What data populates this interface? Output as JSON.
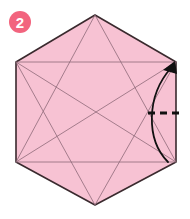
{
  "figure": {
    "title": "Origami hexagon crease pattern diagram",
    "step_label": "2",
    "background_color": "#ffffff"
  },
  "step_badge": {
    "label": "2",
    "fill_color": "#F2647E",
    "text_color": "#FFFFFF",
    "center": {
      "x": 20,
      "y": 22
    },
    "radius": 11
  },
  "shape": {
    "name": "hexagon",
    "fill_color": "#F7C2D3",
    "stroke_color": "#3A2A2E",
    "stroke_width": 1.6,
    "vertices": [
      {
        "x": 95,
        "y": 15
      },
      {
        "x": 176,
        "y": 62
      },
      {
        "x": 176,
        "y": 162
      },
      {
        "x": 95,
        "y": 205
      },
      {
        "x": 16,
        "y": 162
      },
      {
        "x": 16,
        "y": 62
      }
    ]
  },
  "crease_lines": {
    "stroke_color": "#8E6A78",
    "stroke_width": 0.8,
    "segments": [
      {
        "name": "top-horizontal-crease",
        "x1": 16,
        "y1": 62,
        "x2": 176,
        "y2": 62
      },
      {
        "name": "bottom-horizontal-crease",
        "x1": 16,
        "y1": 162,
        "x2": 176,
        "y2": 162
      },
      {
        "name": "top-vertex-to-bottom-left",
        "x1": 95,
        "y1": 15,
        "x2": 16,
        "y2": 162
      },
      {
        "name": "top-vertex-to-bottom-right",
        "x1": 95,
        "y1": 15,
        "x2": 176,
        "y2": 162
      },
      {
        "name": "bottom-vertex-to-top-left",
        "x1": 95,
        "y1": 205,
        "x2": 16,
        "y2": 62
      },
      {
        "name": "bottom-vertex-to-top-right",
        "x1": 95,
        "y1": 205,
        "x2": 176,
        "y2": 62
      },
      {
        "name": "top-left-to-bottom-right-long",
        "x1": 16,
        "y1": 62,
        "x2": 176,
        "y2": 162
      },
      {
        "name": "bottom-left-to-top-right-long",
        "x1": 16,
        "y1": 162,
        "x2": 176,
        "y2": 62
      }
    ]
  },
  "fold_line": {
    "name": "valley-fold-dashed",
    "style": "dashed",
    "stroke_color": "#111111",
    "stroke_width": 3,
    "dash_pattern": "7 5",
    "x1": 148,
    "y1": 113,
    "x2": 180,
    "y2": 113
  },
  "fold_arrow": {
    "name": "fold-direction-arrow",
    "stroke_color": "#111111",
    "stroke_width": 1.8,
    "path": "M 168 162 C 146 140, 146 96, 172 66",
    "head_points": "172,62 163,74 178,75"
  }
}
